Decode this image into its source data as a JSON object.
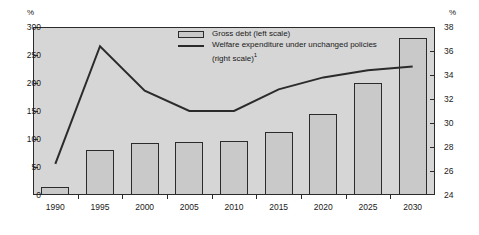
{
  "chart_data": {
    "type": "bar",
    "title": "",
    "subtitle": "",
    "categories": [
      "1990",
      "1995",
      "2000",
      "2005",
      "2010",
      "2015",
      "2020",
      "2025",
      "2030"
    ],
    "xlabel": "",
    "grid": false,
    "legend_position": "top-center",
    "axes": {
      "left": {
        "unit_label": "%",
        "ticks": [
          "0",
          "50",
          "100",
          "150",
          "200",
          "250",
          "300"
        ],
        "ylim": [
          0,
          300
        ],
        "ylabel": "%"
      },
      "right": {
        "unit_label": "%",
        "ticks": [
          "24",
          "26",
          "28",
          "30",
          "32",
          "34",
          "36",
          "38"
        ],
        "ylim": [
          24,
          38
        ],
        "ylabel": "%"
      }
    },
    "series": [
      {
        "name": "Gross debt (left scale)",
        "type": "bar",
        "axis": "left",
        "values": [
          15,
          80,
          93,
          95,
          97,
          113,
          145,
          200,
          280
        ]
      },
      {
        "name": "Welfare expenditure under unchanged policies (right scale)",
        "type": "line",
        "axis": "right",
        "values": [
          26.6,
          36.4,
          32.7,
          31.0,
          31.0,
          32.8,
          33.8,
          34.4,
          34.7
        ]
      }
    ]
  },
  "legend": {
    "entry_bar_label": "Gross debt (left scale)",
    "entry_line_label_line1": "Welfare expenditure under unchanged policies",
    "entry_line_label_line2": "(right scale)",
    "entry_line_footnote": "1"
  },
  "colors": {
    "plot_background": "#d6d6d6",
    "bar_fill": "#c9c9c9",
    "stroke": "#2b2b2b",
    "line": "#2b2b2b",
    "text": "#1a1a1a",
    "page_background": "#ffffff"
  }
}
